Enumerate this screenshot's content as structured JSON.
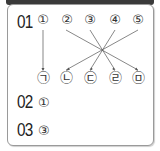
{
  "questions": [
    {
      "number": "01",
      "top_items": [
        "①",
        "②",
        "③",
        "④",
        "⑤"
      ],
      "bottom_items": [
        "㉠",
        "㉡",
        "㉢",
        "㉣",
        "㉤"
      ],
      "matches": [
        {
          "from": "①",
          "to": "㉠"
        },
        {
          "from": "②",
          "to": "㉤"
        },
        {
          "from": "③",
          "to": "㉣"
        },
        {
          "from": "④",
          "to": "㉢"
        },
        {
          "from": "⑤",
          "to": "㉡"
        }
      ]
    },
    {
      "number": "02",
      "answer": "①"
    },
    {
      "number": "03",
      "answer": "③"
    }
  ]
}
